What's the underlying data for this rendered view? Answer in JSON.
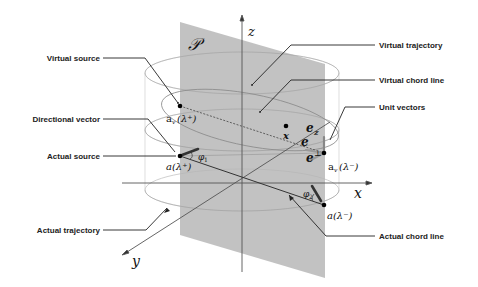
{
  "diagram": {
    "plane_label": "𝒫",
    "axes": {
      "x": "x",
      "y": "y",
      "z": "z"
    },
    "callouts": {
      "virtual_source": "Virtual source",
      "directional_vector": "Directional vector",
      "actual_source": "Actual source",
      "actual_trajectory": "Actual trajectory",
      "virtual_trajectory": "Virtual trajectory",
      "virtual_chord_line": "Virtual chord line",
      "unit_vectors": "Unit vectors",
      "actual_chord_line": "Actual chord line"
    },
    "math_labels": {
      "av_plus_a": "a",
      "av_plus_sub": "v",
      "av_plus_arg": "(λ⁺)",
      "av_minus_a": "a",
      "av_minus_sub": "v",
      "av_minus_arg": "(λ⁻)",
      "a_plus": "a(λ⁺)",
      "a_minus": "a(λ⁻)",
      "x_point": "x",
      "e": "e",
      "e_z": "e",
      "e_z_sub": "z",
      "e_perp": "e",
      "e_perp_sup": "⊥",
      "phi1": "φ",
      "phi1_sub": "1",
      "phi2": "φ",
      "phi2_sub": "2"
    },
    "colors": {
      "plane": "#b4b4b4",
      "ellipse": "#b8b8b8",
      "axis": "#555555",
      "leader": "#222222"
    }
  }
}
